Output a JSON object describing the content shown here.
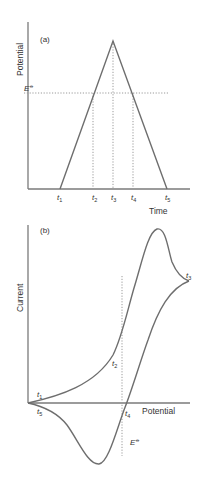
{
  "panel_a": {
    "label": "(a)",
    "ylabel": "Potential",
    "xlabel": "Time",
    "e_label": "E",
    "e_symbol": "⦵",
    "ticks": [
      {
        "t": "t",
        "sub": "1"
      },
      {
        "t": "t",
        "sub": "2"
      },
      {
        "t": "t",
        "sub": "3"
      },
      {
        "t": "t",
        "sub": "4"
      },
      {
        "t": "t",
        "sub": "5"
      }
    ]
  },
  "panel_b": {
    "label": "(b)",
    "ylabel": "Current",
    "xlabel": "Potential",
    "e_label": "E",
    "e_symbol": "⦵",
    "points": [
      {
        "t": "t",
        "sub": "1"
      },
      {
        "t": "t",
        "sub": "2"
      },
      {
        "t": "t",
        "sub": "3"
      },
      {
        "t": "t",
        "sub": "4"
      },
      {
        "t": "t",
        "sub": "5"
      }
    ]
  },
  "colors": {
    "axis": "#7a7a7a",
    "curve": "#6e6e6e",
    "dotted": "#9a9a9a",
    "text": "#333333"
  }
}
